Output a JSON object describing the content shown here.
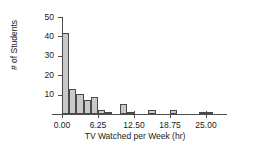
{
  "chart_data": {
    "type": "bar",
    "title": "",
    "subtitle": "",
    "xlabel": "TV Watched per Week (hr)",
    "ylabel": "# of Students",
    "xlim": [
      -1.6,
      28.5
    ],
    "ylim": [
      0,
      50
    ],
    "grid": false,
    "legend": null,
    "bin_width": 1.25,
    "xticks": [
      0,
      6.25,
      12.5,
      18.75,
      25
    ],
    "xtick_labels": [
      "0.00",
      "6.25",
      "12.50",
      "18.75",
      "25.00"
    ],
    "yticks": [
      10,
      20,
      30,
      40,
      50
    ],
    "ytick_labels": [
      "10",
      "20",
      "30",
      "40",
      "50"
    ],
    "bin_starts": [
      0,
      1.25,
      2.5,
      3.75,
      5.0,
      6.25,
      7.5,
      10.0,
      11.25,
      15.0,
      18.75,
      23.75,
      25.0
    ],
    "values": [
      42,
      13,
      10.5,
      7,
      9,
      2,
      1,
      5,
      1,
      2,
      2,
      1,
      1
    ],
    "bars": [
      {
        "start": 0.0,
        "end": 1.25,
        "value": 42
      },
      {
        "start": 1.25,
        "end": 2.5,
        "value": 13
      },
      {
        "start": 2.5,
        "end": 3.75,
        "value": 10.5
      },
      {
        "start": 3.75,
        "end": 5.0,
        "value": 7
      },
      {
        "start": 5.0,
        "end": 6.25,
        "value": 9
      },
      {
        "start": 6.25,
        "end": 7.5,
        "value": 2
      },
      {
        "start": 7.5,
        "end": 8.75,
        "value": 1
      },
      {
        "start": 10.0,
        "end": 11.25,
        "value": 5
      },
      {
        "start": 11.25,
        "end": 12.5,
        "value": 1
      },
      {
        "start": 15.0,
        "end": 16.25,
        "value": 2
      },
      {
        "start": 18.75,
        "end": 20.0,
        "value": 2
      },
      {
        "start": 23.75,
        "end": 25.0,
        "value": 1
      },
      {
        "start": 25.0,
        "end": 26.25,
        "value": 1
      }
    ],
    "colors": {
      "bar_fill": "#c9c9c9",
      "bar_edge": "#4a4a4a",
      "axis": "#4d4d4d",
      "text": "#1a1a1a",
      "background": "#ffffff"
    }
  }
}
